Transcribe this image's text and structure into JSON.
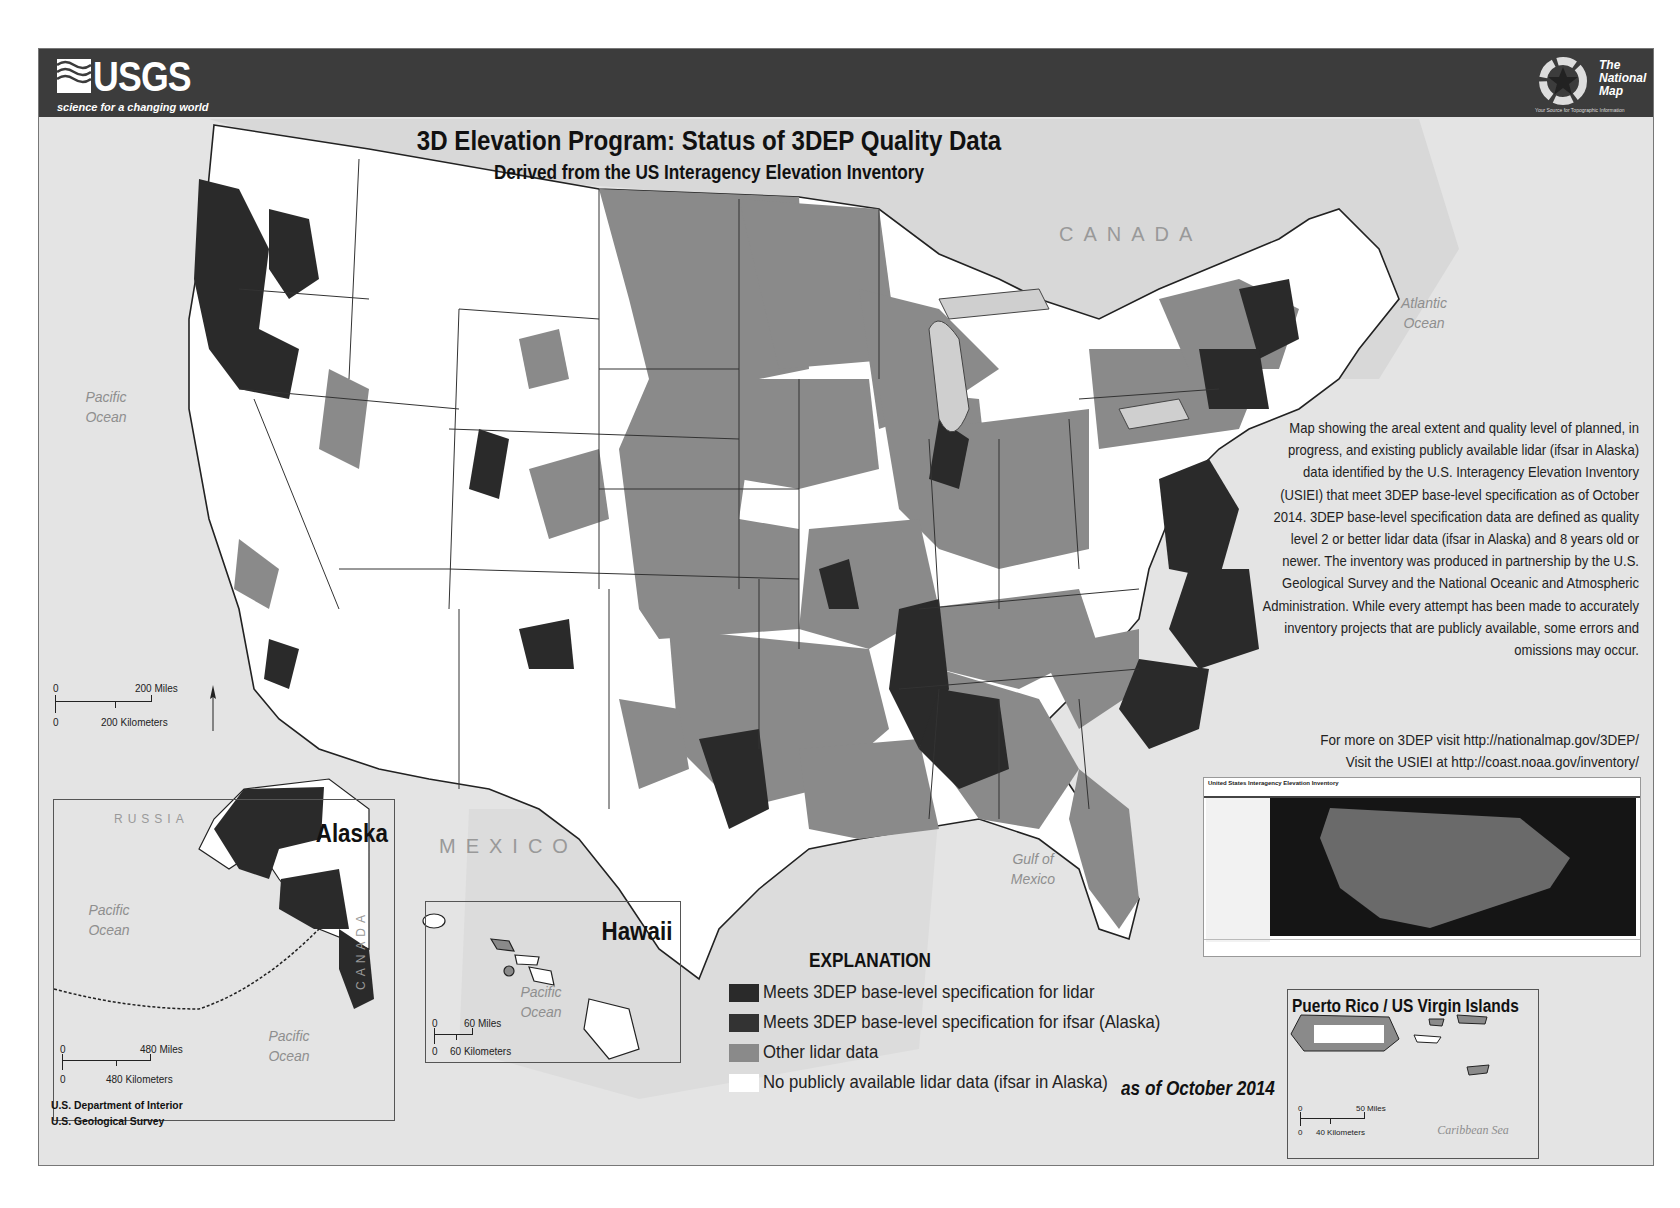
{
  "header": {
    "agency_logo": "USGS",
    "agency_tagline": "science for a changing world",
    "partner_logo_title": [
      "The",
      "National",
      "Map"
    ],
    "partner_logo_tagline": "Your Source for Topographic Information"
  },
  "title": "3D Elevation Program: Status of 3DEP Quality Data",
  "subtitle": "Derived from the US Interagency Elevation Inventory",
  "geo_labels": {
    "canada": "CANADA",
    "mexico": "MEXICO",
    "pacific_ocean": "Pacific Ocean",
    "atlantic_ocean": "Atlantic Ocean",
    "gulf_of_mexico": "Gulf of Mexico"
  },
  "description": "Map showing the areal extent and quality level of planned, in progress, and existing publicly available lidar (ifsar in Alaska) data identified by the U.S. Interagency Elevation Inventory (USIEI) that meet 3DEP base-level specification as of October 2014. 3DEP base-level specification data are defined as quality level 2 or better lidar data (ifsar in Alaska) and 8 years old or newer. The inventory was produced in partnership by the U.S. Geological Survey and the National Oceanic and Atmospheric Administration. While every attempt has been made to accurately inventory projects that are publicly available, some errors and omissions may occur.",
  "links": {
    "line1": "For more on 3DEP visit http://nationalmap.gov/3DEP/",
    "line2": "Visit the USIEI at http://coast.noaa.gov/inventory/"
  },
  "usiei_screenshot": {
    "header": "United States Interagency Elevation Inventory",
    "logos": [
      "NOAA",
      "USGS",
      "USDA",
      "FEMA"
    ]
  },
  "legend": {
    "title": "EXPLANATION",
    "items": [
      {
        "label": "Meets 3DEP base-level specification for lidar",
        "color": "#2a2a2a"
      },
      {
        "label": "Meets 3DEP base-level specification for ifsar (Alaska)",
        "color": "#333333"
      },
      {
        "label": "Other lidar data",
        "color": "#8a8a8a"
      },
      {
        "label": "No publicly available lidar data (ifsar in Alaska)",
        "color": "#ffffff"
      }
    ],
    "as_of": "as of October 2014"
  },
  "main_scale": {
    "miles_zero": "0",
    "miles": "200 Miles",
    "km_zero": "0",
    "km": "200 Kilometers"
  },
  "insets": {
    "alaska": {
      "title": "Alaska",
      "labels": {
        "russia": "RUSSIA",
        "canada": "CANADA",
        "pacific1": "Pacific Ocean",
        "pacific2": "Pacific Ocean"
      },
      "scale": {
        "miles_zero": "0",
        "miles": "480 Miles",
        "km_zero": "0",
        "km": "480 Kilometers"
      }
    },
    "hawaii": {
      "title": "Hawaii",
      "labels": {
        "pacific": "Pacific Ocean"
      },
      "scale": {
        "miles_zero": "0",
        "miles": "60 Miles",
        "km_zero": "0",
        "km": "60 Kilometers"
      }
    },
    "puerto_rico": {
      "title": "Puerto Rico / US Virgin Islands",
      "labels": {
        "sea": "Caribbean Sea"
      },
      "scale": {
        "miles_zero": "0",
        "miles": "50 Miles",
        "km_zero": "0",
        "km": "40 Kilometers"
      }
    }
  },
  "footer": {
    "line1": "U.S. Department of Interior",
    "line2": "U.S. Geological Survey"
  },
  "colors": {
    "banner": "#3c3c3c",
    "background": "#e4e4e4",
    "meets_lidar": "#2a2a2a",
    "other_lidar": "#8a8a8a",
    "no_data": "#ffffff"
  }
}
